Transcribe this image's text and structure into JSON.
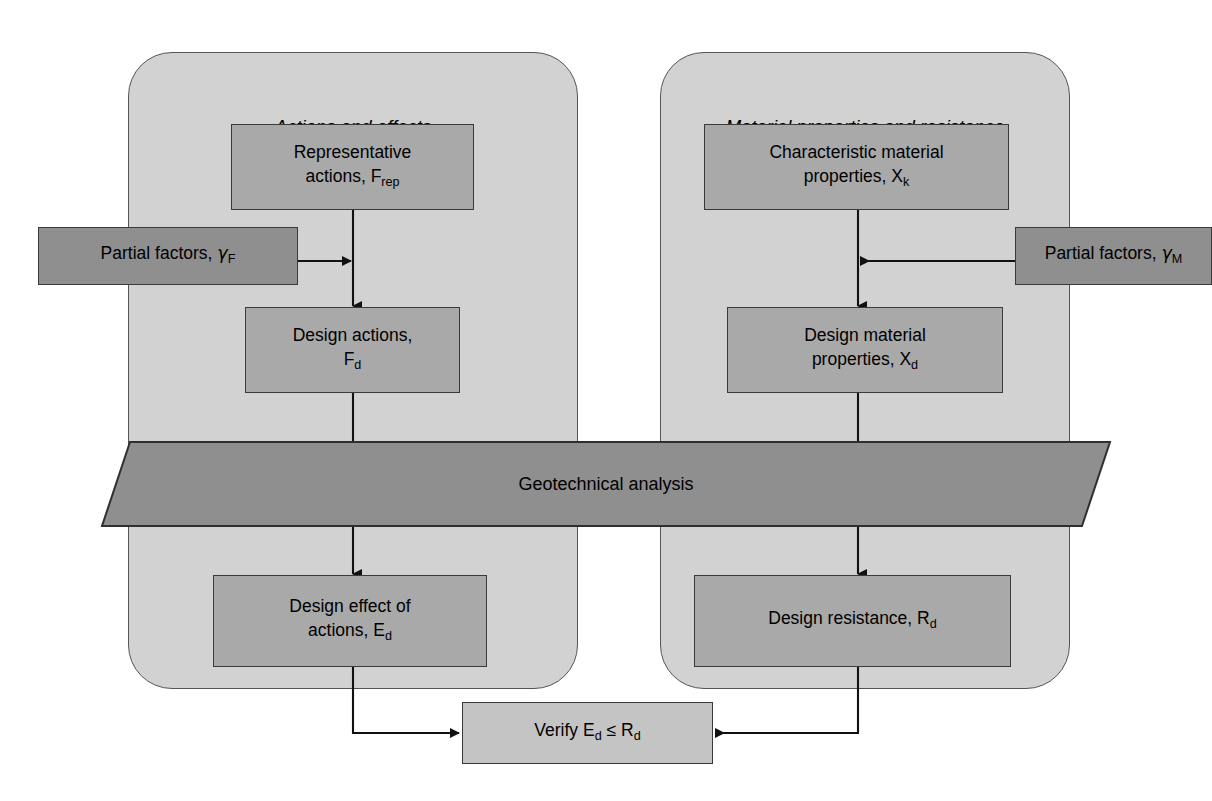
{
  "diagram": {
    "panels": [
      {
        "id": "actions",
        "title": "Actions and effects"
      },
      {
        "id": "materials",
        "title": "Material properties and resistance"
      }
    ],
    "nodes": {
      "representative_actions": {
        "line1": "Representative",
        "line2": "actions, F",
        "sub2": "rep"
      },
      "partial_factors_f": {
        "text": "Partial factors, ",
        "symbol": "γ",
        "sub": "F"
      },
      "design_actions": {
        "line1": "Design actions,",
        "line2": "F",
        "sub2": "d"
      },
      "design_effect": {
        "line1": "Design effect of",
        "line2": "actions, E",
        "sub2": "d"
      },
      "characteristic_material": {
        "line1": "Characteristic material",
        "line2": "properties, X",
        "sub2": "k"
      },
      "partial_factors_m": {
        "text": "Partial factors, ",
        "symbol": "γ",
        "sub": "M"
      },
      "design_material": {
        "line1": "Design material",
        "line2": "properties, X",
        "sub2": "d"
      },
      "design_resistance": {
        "text": "Design resistance, R",
        "sub": "d"
      },
      "geotechnical_analysis": {
        "text": "Geotechnical analysis"
      },
      "verify": {
        "pre": "Verify E",
        "sub1": "d",
        "mid": " ≤ R",
        "sub2": "d"
      }
    },
    "colors": {
      "panel_fill": "#d2d2d2",
      "node_fill": "#a9a9a9",
      "node_light_fill": "#c4c4c4",
      "node_dark_fill": "#8f8f8f",
      "stroke": "#3a3a3a",
      "background": "#ffffff"
    },
    "edges": [
      {
        "from": "representative_actions",
        "to": "design_actions"
      },
      {
        "from": "partial_factors_f",
        "to": "design_actions"
      },
      {
        "from": "design_actions",
        "to": "geotechnical_analysis"
      },
      {
        "from": "characteristic_material",
        "to": "design_material"
      },
      {
        "from": "partial_factors_m",
        "to": "design_material"
      },
      {
        "from": "design_material",
        "to": "geotechnical_analysis"
      },
      {
        "from": "geotechnical_analysis",
        "to": "design_effect"
      },
      {
        "from": "geotechnical_analysis",
        "to": "design_resistance"
      },
      {
        "from": "design_effect",
        "to": "verify"
      },
      {
        "from": "design_resistance",
        "to": "verify"
      }
    ]
  }
}
